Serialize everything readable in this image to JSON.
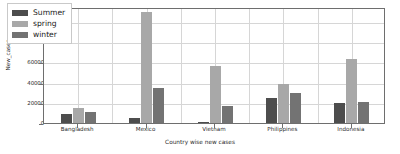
{
  "chart_data": {
    "type": "bar",
    "title": "",
    "xlabel": "Country wise new cases",
    "ylabel": "New_cases",
    "categories": [
      "Bangladesh",
      "Mexico",
      "Vietnam",
      "Philippines",
      "Indonesia"
    ],
    "series": [
      {
        "name": "Summer",
        "color": "#4d4d4d",
        "values": [
          9000,
          5000,
          1200,
          25000,
          20000
        ]
      },
      {
        "name": "spring",
        "color": "#a8a8a8",
        "values": [
          14500,
          110000,
          57000,
          39000,
          63000
        ]
      },
      {
        "name": "winter",
        "color": "#737373",
        "values": [
          11000,
          35000,
          17000,
          30000,
          21000
        ]
      }
    ],
    "ylim": [
      0,
      115000
    ],
    "yticks": [
      0,
      20000,
      40000,
      60000,
      80000,
      100000
    ],
    "ytick_labels": [
      "0",
      "20000",
      "40000",
      "60000",
      "80000",
      "100000"
    ],
    "grid": true,
    "legend_position": "upper left",
    "legend_entries": [
      "Summer",
      "spring",
      "winter"
    ]
  }
}
